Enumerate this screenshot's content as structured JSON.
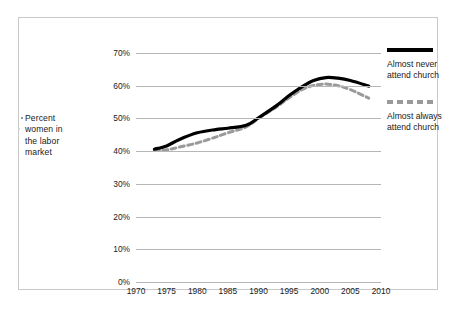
{
  "figure": {
    "y_axis_title_lines": [
      "Percent",
      "women in",
      "the labor",
      "market"
    ]
  },
  "legend": {
    "position": "right",
    "entries": [
      {
        "name": "almost-never",
        "label_line1": "Almost never",
        "label_line2": "attend church",
        "style": "solid",
        "color": "#000000"
      },
      {
        "name": "almost-always",
        "label_line1": "Almost always",
        "label_line2": "attend church",
        "style": "dashed",
        "color": "#9a9a9a"
      }
    ]
  },
  "chart_data": {
    "type": "line",
    "title": "",
    "subtitle": "",
    "xlabel": "",
    "ylabel": "Percent women in the labor market",
    "xlim": [
      1970,
      2010
    ],
    "ylim": [
      0,
      70
    ],
    "grid": true,
    "legend_position": "right",
    "x_ticks": [
      1970,
      1975,
      1980,
      1985,
      1990,
      1995,
      2000,
      2005,
      2010
    ],
    "x_tick_labels": [
      "1970",
      "1975",
      "1980",
      "1985",
      "1990",
      "1995",
      "2000",
      "2005",
      "2010"
    ],
    "y_ticks": [
      0,
      10,
      20,
      30,
      40,
      50,
      60,
      70
    ],
    "y_tick_labels": [
      "0%",
      "10%",
      "20%",
      "30%",
      "40%",
      "50%",
      "60%",
      "70%"
    ],
    "series": [
      {
        "name": "Almost never attend church",
        "style": "solid",
        "color": "#000000",
        "x": [
          1973,
          1975,
          1977,
          1980,
          1983,
          1985,
          1988,
          1990,
          1993,
          1995,
          1997,
          1999,
          2001,
          2003,
          2005,
          2008
        ],
        "values": [
          40.6,
          41.6,
          43.5,
          45.6,
          46.6,
          47.0,
          47.9,
          50.2,
          54.0,
          57.0,
          59.6,
          61.6,
          62.5,
          62.3,
          61.6,
          59.9
        ]
      },
      {
        "name": "Almost always attend church",
        "style": "dashed",
        "color": "#9a9a9a",
        "x": [
          1973,
          1975,
          1977,
          1980,
          1983,
          1985,
          1988,
          1990,
          1993,
          1995,
          1997,
          1999,
          2001,
          2003,
          2005,
          2008
        ],
        "values": [
          40.2,
          40.4,
          41.2,
          42.5,
          44.3,
          45.6,
          47.4,
          50.0,
          53.6,
          56.3,
          58.7,
          60.1,
          60.5,
          60.0,
          58.8,
          56.2
        ]
      }
    ]
  }
}
